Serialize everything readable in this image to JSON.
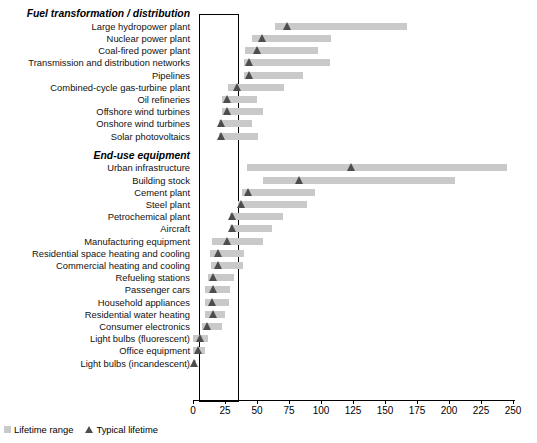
{
  "chart_data": {
    "type": "bar",
    "title": "",
    "subtitle": "",
    "xlabel": "",
    "ylabel": "",
    "xlim": [
      0,
      250
    ],
    "grid": false,
    "legend_position": "bottom-left",
    "xticks": [
      0,
      25,
      50,
      75,
      100,
      125,
      150,
      175,
      200,
      225,
      250
    ],
    "xtick_labels": [
      "0",
      "25",
      "50",
      "75",
      "100",
      "125",
      "150",
      "175",
      "200",
      "225",
      "250"
    ],
    "legend": [
      {
        "label": "Lifetime range",
        "marker": "square",
        "color": "#c9c9c9"
      },
      {
        "label": "Typical lifetime",
        "marker": "triangle",
        "color": "#4d4d4d"
      }
    ],
    "groups": [
      {
        "name": "Fuel transformation / distribution",
        "rows": [
          {
            "label": "Large hydropower plant",
            "range": [
              64,
              167
            ],
            "typical": 74
          },
          {
            "label": "Nuclear power plant",
            "range": [
              46,
              108
            ],
            "typical": 54
          },
          {
            "label": "Coal-fired power plant",
            "range": [
              41,
              98
            ],
            "typical": 50
          },
          {
            "label": "Transmission and distribution networks",
            "range": [
              40,
              107
            ],
            "typical": 44
          },
          {
            "label": "Pipelines",
            "range": [
              40,
              86
            ],
            "typical": 44
          },
          {
            "label": "Combined-cycle gas-turbine plant",
            "range": [
              27,
              71
            ],
            "typical": 35
          },
          {
            "label": "Oil refineries",
            "range": [
              23,
              50
            ],
            "typical": 27
          },
          {
            "label": "Offshore wind turbines",
            "range": [
              23,
              55
            ],
            "typical": 27
          },
          {
            "label": "Onshore wind turbines",
            "range": [
              20,
              46
            ],
            "typical": 22
          },
          {
            "label": "Solar photovoltaics",
            "range": [
              20,
              51
            ],
            "typical": 22
          }
        ]
      },
      {
        "name": "End-use equipment",
        "rows": [
          {
            "label": "Urban infrastructure",
            "range": [
              42,
              245
            ],
            "typical": 124
          },
          {
            "label": "Building stock",
            "range": [
              55,
              205
            ],
            "typical": 83
          },
          {
            "label": "Cement plant",
            "range": [
              38,
              95
            ],
            "typical": 43
          },
          {
            "label": "Steel plant",
            "range": [
              35,
              89
            ],
            "typical": 38
          },
          {
            "label": "Petrochemical plant",
            "range": [
              29,
              70
            ],
            "typical": 31
          },
          {
            "label": "Aircraft",
            "range": [
              29,
              62
            ],
            "typical": 31
          },
          {
            "label": "Manufacturing equipment",
            "range": [
              15,
              55
            ],
            "typical": 27
          },
          {
            "label": "Residential space heating and cooling",
            "range": [
              13,
              40
            ],
            "typical": 20
          },
          {
            "label": "Commercial heating and cooling",
            "range": [
              14,
              39
            ],
            "typical": 20
          },
          {
            "label": "Refueling stations",
            "range": [
              12,
              32
            ],
            "typical": 16
          },
          {
            "label": "Passenger cars",
            "range": [
              9,
              29
            ],
            "typical": 16
          },
          {
            "label": "Household appliances",
            "range": [
              9,
              28
            ],
            "typical": 15
          },
          {
            "label": "Residential water heating",
            "range": [
              9,
              25
            ],
            "typical": 16
          },
          {
            "label": "Consumer electronics",
            "range": [
              7,
              23
            ],
            "typical": 11
          },
          {
            "label": "Light bulbs (fluorescent)",
            "range": [
              0,
              12
            ],
            "typical": 6
          },
          {
            "label": "Office equipment",
            "range": [
              0,
              9
            ],
            "typical": 4
          },
          {
            "label": "Light bulbs (incandescent)",
            "range": [
              0,
              2
            ],
            "typical": 1
          }
        ]
      }
    ]
  }
}
